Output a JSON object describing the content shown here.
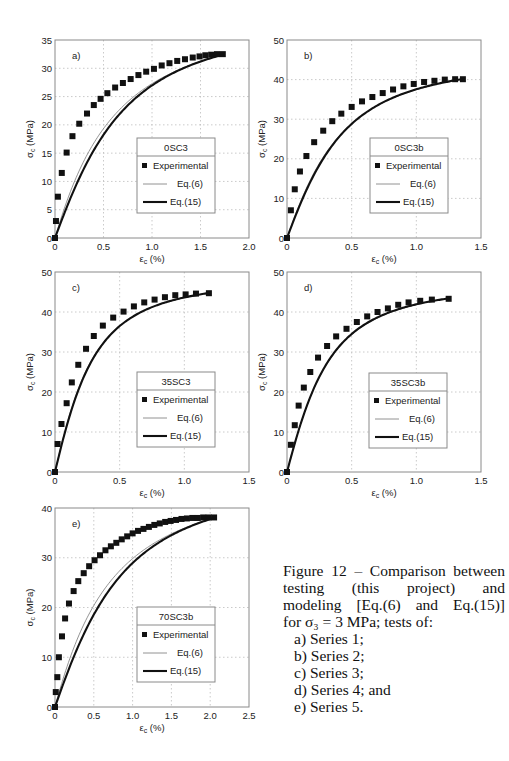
{
  "chart_data": [
    {
      "id": "a",
      "type": "scatter+line",
      "panel_label": "a)",
      "legend_title": "0SC3",
      "legend": [
        "Experimental",
        "Eq.(6)",
        "Eq.(15)"
      ],
      "xlabel": "εc (%)",
      "ylabel": "σc (MPa)",
      "xlim": [
        0,
        2.0
      ],
      "ylim": [
        0,
        35
      ],
      "xticks": [
        0,
        0.5,
        1.0,
        1.5,
        2.0
      ],
      "xtick_labels": [
        "0",
        "0.5",
        "1.0",
        "1.5",
        "2.0"
      ],
      "yticks": [
        0,
        5,
        10,
        15,
        20,
        25,
        30,
        35
      ],
      "ytick_labels": [
        "0",
        "5",
        "10",
        "15",
        "20",
        "25",
        "30",
        "35"
      ],
      "grid": true,
      "frame": {
        "left": 55,
        "top": 40,
        "width": 194,
        "height": 198
      },
      "legend_box": {
        "left": 137,
        "top": 138,
        "width": 78,
        "height": 75
      },
      "peak": 32.5,
      "eps_max": 1.75,
      "series": [
        {
          "name": "Experimental",
          "marker": "square",
          "x": [
            0,
            0.01,
            0.03,
            0.07,
            0.12,
            0.18,
            0.25,
            0.33,
            0.4,
            0.47,
            0.54,
            0.62,
            0.7,
            0.78,
            0.86,
            0.94,
            1.02,
            1.1,
            1.18,
            1.26,
            1.34,
            1.42,
            1.49,
            1.55,
            1.61,
            1.67,
            1.73
          ],
          "y": [
            0,
            3,
            7.3,
            11.5,
            15.1,
            18,
            20.2,
            22,
            23.5,
            24.6,
            25.6,
            26.6,
            27.4,
            28.1,
            28.8,
            29.4,
            29.9,
            30.5,
            30.9,
            31.3,
            31.6,
            31.9,
            32.1,
            32.3,
            32.4,
            32.5,
            32.5
          ]
        },
        {
          "name": "Eq.(6)",
          "style": "thin",
          "k": 0.4,
          "n": 1.25
        },
        {
          "name": "Eq.(15)",
          "style": "thick",
          "k": 0.48,
          "n": 1.55
        }
      ]
    },
    {
      "id": "b",
      "type": "scatter+line",
      "panel_label": "b)",
      "legend_title": "0SC3b",
      "legend": [
        "Experimental",
        "Eq.(6)",
        "Eq.(15)"
      ],
      "xlabel": "εc (%)",
      "ylabel": "σc (MPa)",
      "xlim": [
        0,
        1.5
      ],
      "ylim": [
        0,
        50
      ],
      "xticks": [
        0,
        0.5,
        1.0,
        1.5
      ],
      "xtick_labels": [
        "0",
        "0.5",
        "1.0",
        "1.5"
      ],
      "yticks": [
        0,
        10,
        20,
        30,
        40,
        50
      ],
      "ytick_labels": [
        "0",
        "10",
        "20",
        "30",
        "40",
        "50"
      ],
      "grid": true,
      "frame": {
        "left": 287,
        "top": 40,
        "width": 194,
        "height": 198
      },
      "legend_box": {
        "left": 370,
        "top": 138,
        "width": 78,
        "height": 75
      },
      "peak": 40.2,
      "eps_max": 1.37,
      "series": [
        {
          "name": "Experimental",
          "marker": "square",
          "x": [
            0,
            0.03,
            0.06,
            0.1,
            0.15,
            0.21,
            0.28,
            0.35,
            0.42,
            0.5,
            0.58,
            0.66,
            0.74,
            0.82,
            0.9,
            0.98,
            1.06,
            1.14,
            1.22,
            1.3,
            1.36
          ],
          "y": [
            0,
            7,
            12.3,
            16.8,
            20.7,
            24.2,
            27.1,
            29.5,
            31.4,
            33.1,
            34.5,
            35.6,
            36.6,
            37.5,
            38.3,
            38.9,
            39.4,
            39.7,
            40,
            40.1,
            40.1
          ]
        },
        {
          "name": "Eq.(6)",
          "style": "thin",
          "k": 0.36,
          "n": 1.45
        },
        {
          "name": "Eq.(15)",
          "style": "thick",
          "k": 0.38,
          "n": 1.6
        }
      ]
    },
    {
      "id": "c",
      "type": "scatter+line",
      "panel_label": "c)",
      "legend_title": "35SC3",
      "legend": [
        "Experimental",
        "Eq.(6)",
        "Eq.(15)"
      ],
      "xlabel": "εc (%)",
      "ylabel": "σc (MPa)",
      "xlim": [
        0,
        1.5
      ],
      "ylim": [
        0,
        50
      ],
      "xticks": [
        0,
        0.5,
        1.0,
        1.5
      ],
      "xtick_labels": [
        "0",
        "0.5",
        "1.0",
        "1.5"
      ],
      "yticks": [
        0,
        10,
        20,
        30,
        40,
        50
      ],
      "ytick_labels": [
        "0",
        "10",
        "20",
        "30",
        "40",
        "50"
      ],
      "grid": true,
      "frame": {
        "left": 55,
        "top": 272,
        "width": 194,
        "height": 200
      },
      "legend_box": {
        "left": 137,
        "top": 372,
        "width": 78,
        "height": 75
      },
      "peak": 44.8,
      "eps_max": 1.2,
      "series": [
        {
          "name": "Experimental",
          "marker": "square",
          "x": [
            0,
            0.02,
            0.05,
            0.09,
            0.13,
            0.18,
            0.24,
            0.3,
            0.37,
            0.45,
            0.53,
            0.61,
            0.69,
            0.77,
            0.85,
            0.93,
            1.01,
            1.09,
            1.19
          ],
          "y": [
            0,
            7,
            12,
            17.2,
            22.4,
            26.8,
            30.8,
            34,
            36.6,
            38.6,
            40.1,
            41.4,
            42.4,
            43.1,
            43.7,
            44.2,
            44.4,
            44.6,
            44.7
          ]
        },
        {
          "name": "Eq.(6)",
          "style": "thin",
          "k": 0.29,
          "n": 1.55
        },
        {
          "name": "Eq.(15)",
          "style": "thick",
          "k": 0.3,
          "n": 1.6
        }
      ]
    },
    {
      "id": "d",
      "type": "scatter+line",
      "panel_label": "d)",
      "legend_title": "35SC3b",
      "legend": [
        "Experimental",
        "Eq.(6)",
        "Eq.(15)"
      ],
      "xlabel": "εc (%)",
      "ylabel": "σc (MPa)",
      "xlim": [
        0,
        1.5
      ],
      "ylim": [
        0,
        50
      ],
      "xticks": [
        0,
        0.5,
        1.0,
        1.5
      ],
      "xtick_labels": [
        "0",
        "0.5",
        "1.0",
        "1.5"
      ],
      "yticks": [
        0,
        10,
        20,
        30,
        40,
        50
      ],
      "ytick_labels": [
        "0",
        "10",
        "20",
        "30",
        "40",
        "50"
      ],
      "grid": true,
      "frame": {
        "left": 287,
        "top": 272,
        "width": 194,
        "height": 200
      },
      "legend_box": {
        "left": 369,
        "top": 373,
        "width": 78,
        "height": 75
      },
      "peak": 43.4,
      "eps_max": 1.25,
      "series": [
        {
          "name": "Experimental",
          "marker": "square",
          "x": [
            0,
            0.03,
            0.06,
            0.09,
            0.13,
            0.18,
            0.24,
            0.31,
            0.38,
            0.46,
            0.54,
            0.62,
            0.7,
            0.78,
            0.86,
            0.94,
            1.03,
            1.12,
            1.25
          ],
          "y": [
            0,
            6.8,
            11.7,
            16.6,
            21.1,
            25,
            28.6,
            31.5,
            33.9,
            35.8,
            37.5,
            38.9,
            40,
            40.9,
            41.8,
            42.4,
            42.8,
            43.1,
            43.3
          ]
        },
        {
          "name": "Eq.(6)",
          "style": "thin",
          "k": 0.31,
          "n": 1.55
        },
        {
          "name": "Eq.(15)",
          "style": "thick",
          "k": 0.31,
          "n": 1.6
        }
      ]
    },
    {
      "id": "e",
      "type": "scatter+line",
      "panel_label": "e)",
      "legend_title": "70SC3b",
      "legend": [
        "Experimental",
        "Eq.(6)",
        "Eq.(15)"
      ],
      "xlabel": "εc (%)",
      "ylabel": "σc (MPa)",
      "xlim": [
        0,
        2.5
      ],
      "ylim": [
        0,
        40
      ],
      "xticks": [
        0,
        0.5,
        1.0,
        1.5,
        2.0,
        2.5
      ],
      "xtick_labels": [
        "0",
        "0.5",
        "1.0",
        "1.5",
        "2.0",
        "2.5"
      ],
      "yticks": [
        0,
        10,
        20,
        30,
        40
      ],
      "ytick_labels": [
        "0",
        "10",
        "20",
        "30",
        "40"
      ],
      "grid": true,
      "frame": {
        "left": 55,
        "top": 508,
        "width": 194,
        "height": 199
      },
      "legend_box": {
        "left": 137,
        "top": 607,
        "width": 78,
        "height": 75
      },
      "peak": 38.1,
      "eps_max": 2.07,
      "series": [
        {
          "name": "Experimental",
          "marker": "square",
          "x": [
            0,
            0.01,
            0.03,
            0.05,
            0.09,
            0.13,
            0.18,
            0.24,
            0.3,
            0.37,
            0.44,
            0.51,
            0.58,
            0.65,
            0.72,
            0.79,
            0.86,
            0.93,
            1.0,
            1.07,
            1.14,
            1.21,
            1.28,
            1.35,
            1.42,
            1.49,
            1.56,
            1.63,
            1.7,
            1.77,
            1.84,
            1.91,
            1.98,
            2.05
          ],
          "y": [
            0,
            3,
            6,
            10,
            14.2,
            17.8,
            20.8,
            23.3,
            25.3,
            26.9,
            28.3,
            29.5,
            30.5,
            31.5,
            32.3,
            33.0,
            33.7,
            34.3,
            34.9,
            35.4,
            35.8,
            36.2,
            36.6,
            36.9,
            37.2,
            37.4,
            37.6,
            37.8,
            37.9,
            38.0,
            38.0,
            38.1,
            38.1,
            38.1
          ]
        },
        {
          "name": "Eq.(6)",
          "style": "thin",
          "k": 0.4,
          "n": 1.25
        },
        {
          "name": "Eq.(15)",
          "style": "thick",
          "k": 0.5,
          "n": 1.55
        }
      ]
    }
  ],
  "caption": {
    "lines": [
      "Figure 12 – Comparison between",
      "testing (this project) and",
      "modeling [Eq.(6) and Eq.(15)]",
      "for σ₃ = 3 MPa; tests of:"
    ],
    "items": [
      "a) Series 1;",
      "b) Series 2;",
      "c) Series 3;",
      "d) Series 4; and",
      "e) Series 5."
    ]
  }
}
